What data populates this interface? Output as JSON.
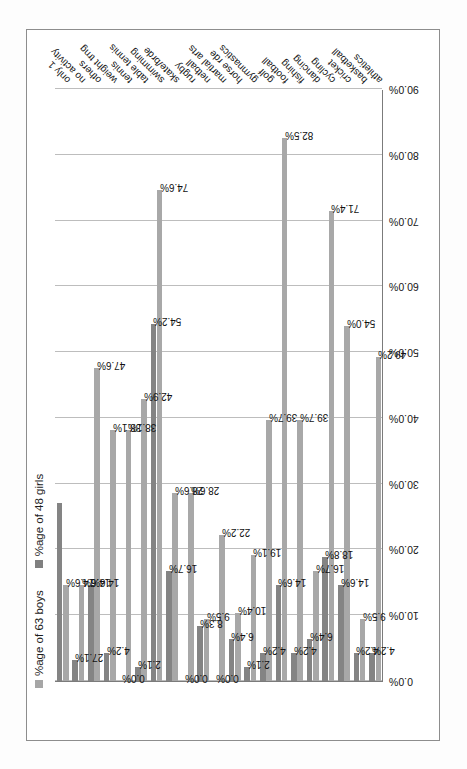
{
  "chart_data": {
    "type": "bar",
    "orientation": "horizontal",
    "title": "",
    "xlabel": "",
    "ylabel": "",
    "grid": true,
    "legend_position": "top-left",
    "axis_ticks": [
      "0.0%",
      "10.0%",
      "20.0%",
      "30.0%",
      "40.0%",
      "50.0%",
      "60.0%",
      "70.0%",
      "80.0%",
      "90.0%"
    ],
    "axis_tick_values": [
      0,
      10,
      20,
      30,
      40,
      50,
      60,
      70,
      80,
      90
    ],
    "xlim": [
      0,
      90
    ],
    "categories": [
      "athletics",
      "basketball",
      "cricket",
      "cycling",
      "dancing",
      "fishing",
      "football",
      "golf",
      "gymnastics",
      "horse rde",
      "martial arts",
      "netball",
      "rugby",
      "skate/brde",
      "swimming",
      "table tennis",
      "tennis",
      "weight trng",
      "others",
      "no activity",
      "only 1"
    ],
    "series": [
      {
        "name": "%age of 63 boys",
        "color": "#a8a8a8",
        "values": [
          49.2,
          9.5,
          54.0,
          71.4,
          16.7,
          39.7,
          82.5,
          39.7,
          19.1,
          10.4,
          22.2,
          9.5,
          28.6,
          28.6,
          74.6,
          42.9,
          38.1,
          38.1,
          47.6,
          14.6,
          14.6
        ],
        "labels": [
          "49.2%",
          "9.5%",
          "54.0%",
          "71.4%",
          "16.7%",
          "39.7%",
          "82.5%",
          "39.7%",
          "19.1%",
          "10.4%",
          "22.2%",
          "9.5%",
          "28.6%",
          "28.6%",
          "74.6%",
          "42.9%",
          "38.1%",
          "38.1%",
          "47.6%",
          "14.6%",
          "14.6%"
        ]
      },
      {
        "name": "%age of 48 girls",
        "color": "#848484",
        "values": [
          4.2,
          4.2,
          14.6,
          18.8,
          6.4,
          4.2,
          14.6,
          4.2,
          2.1,
          6.4,
          0.0,
          8.3,
          0.0,
          16.7,
          54.2,
          2.1,
          0.0,
          4.2,
          14.6,
          3.2,
          27.1
        ],
        "labels": [
          "4.2%",
          "4.2%",
          "14.6%",
          "18.8%",
          "6.4%",
          "4.2%",
          "14.6%",
          "4.2%",
          "2.1%",
          "6.4%",
          "0.0%",
          "8.3%",
          "0.0%",
          "16.7%",
          "54.2%",
          "2.1%",
          "0.0%",
          "4.2%",
          "14.6%",
          "27.1%"
        ]
      }
    ]
  },
  "legend": {
    "boys": "%age of 63 boys",
    "girls": "%age of 48 girls"
  }
}
